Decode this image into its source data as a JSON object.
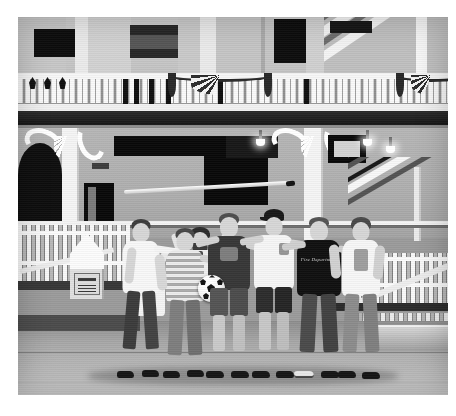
{
  "image": {
    "type": "photograph",
    "color_mode": "black-and-white",
    "width": 456,
    "height": 416,
    "border_color": "#ffffff",
    "photo_frame": {
      "left": 18,
      "top": 17,
      "width": 430,
      "height": 378
    },
    "description": "Black and white photo of a group of seven people posing in front of a Victorian style building with a balcony, patriotic bunting, decorative scroll brackets and white railings."
  },
  "scene": {
    "setting_label": "Victorian building exterior courtyard",
    "upper_storey": {
      "label": "Upper balcony",
      "balustrade_label": "White turned balusters",
      "bunting_count": 2,
      "window_count": 4,
      "column_count": 3
    },
    "lower_storey": {
      "label": "Covered porch",
      "bracket_label": "Carved scroll bracket",
      "bracket_count": 2,
      "lamp_count": 3,
      "door_label": "Dark doorway",
      "staircase_label": "Interior staircase"
    },
    "foreground": {
      "fence_label": "White picket fence",
      "finial_label": "Pointed post finial",
      "plaque_label": "Wall plaque sign",
      "bench_label": "Stone bench",
      "ground_label": "Concrete pavement"
    },
    "props": {
      "pole_label": "Long horizontal pole held overhead",
      "ball_label": "Soccer ball"
    }
  },
  "people": {
    "count": 7,
    "members": [
      {
        "id": 1,
        "name": "person-back-row-left",
        "top_label": "light shirt",
        "note": "partly hidden, arm raised holding pole"
      },
      {
        "id": 2,
        "name": "person-back-row-center",
        "top_label": "shirt and necktie",
        "note": "bearded, arms raised holding pole"
      },
      {
        "id": 3,
        "name": "person-white-tshirt",
        "top_label": "white t-shirt",
        "note": "left end of front row"
      },
      {
        "id": 4,
        "name": "person-striped-shirt",
        "top_label": "striped t-shirt",
        "note": "second from left"
      },
      {
        "id": 5,
        "name": "person-holding-ball",
        "top_label": "dark graphic t-shirt",
        "note": "holds the soccer ball, wears shorts"
      },
      {
        "id": 6,
        "name": "person-with-cap",
        "top_label": "white t-shirt, cap",
        "note": "wears a baseball cap and dark shorts"
      },
      {
        "id": 7,
        "name": "person-black-shirt",
        "top_label": "black t-shirt",
        "note": "script logo across chest"
      },
      {
        "id": 8,
        "name": "person-right-end",
        "top_label": "white graphic t-shirt",
        "note": "right end of the row"
      }
    ],
    "shirt_script_text": "Fire Department"
  },
  "palette": {
    "paper_white": "#ffffff",
    "highlight": "#f5f5f5",
    "light_gray": "#c9c9c9",
    "mid_gray": "#a8a8a8",
    "dark_gray": "#3b3b3b",
    "shadow_black": "#111111",
    "skin_tone": "#dcd2c8"
  }
}
